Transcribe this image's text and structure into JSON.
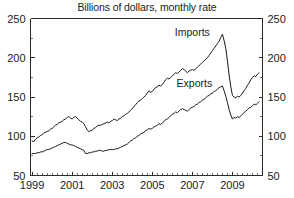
{
  "figure": {
    "subtitle": "Billions of dollars, monthly rate",
    "cut_off_title_fragment": "U.S. International Trade"
  },
  "chart_data": {
    "type": "line",
    "title": "",
    "subtitle": "Billions of dollars, monthly rate",
    "xlabel": "",
    "ylabel": "Billions of dollars, monthly rate",
    "xlim": [
      1998.92,
      2010.5
    ],
    "ylim": [
      50,
      250
    ],
    "ytick_labels": [
      "50",
      "100",
      "150",
      "200",
      "250"
    ],
    "ytick_values": [
      50,
      100,
      150,
      200,
      250
    ],
    "yminor_step": 25,
    "xtick_labels": [
      "1999",
      "2001",
      "2003",
      "2005",
      "2007",
      "2009"
    ],
    "xtick_values": [
      1999,
      2001,
      2003,
      2005,
      2007,
      2009
    ],
    "xminor_step": 0.25,
    "grid": false,
    "legend_position": "inline-annotation",
    "dual_y_axis": true,
    "right_axis_tick_labels": [
      "50",
      "100",
      "150",
      "200",
      "250"
    ],
    "annotations": [
      {
        "text": "Imports",
        "x": 2007.0,
        "y": 228
      },
      {
        "text": "Exports",
        "x": 2007.1,
        "y": 163
      }
    ],
    "series": [
      {
        "name": "Imports",
        "x": [
          1999.0,
          1999.083,
          1999.167,
          1999.25,
          1999.333,
          1999.417,
          1999.5,
          1999.583,
          1999.667,
          1999.75,
          1999.833,
          1999.917,
          2000.0,
          2000.083,
          2000.167,
          2000.25,
          2000.333,
          2000.417,
          2000.5,
          2000.583,
          2000.667,
          2000.75,
          2000.833,
          2000.917,
          2001.0,
          2001.083,
          2001.167,
          2001.25,
          2001.333,
          2001.417,
          2001.5,
          2001.583,
          2001.667,
          2001.75,
          2001.833,
          2001.917,
          2002.0,
          2002.083,
          2002.167,
          2002.25,
          2002.333,
          2002.417,
          2002.5,
          2002.583,
          2002.667,
          2002.75,
          2002.833,
          2002.917,
          2003.0,
          2003.083,
          2003.167,
          2003.25,
          2003.333,
          2003.417,
          2003.5,
          2003.583,
          2003.667,
          2003.75,
          2003.833,
          2003.917,
          2004.0,
          2004.083,
          2004.167,
          2004.25,
          2004.333,
          2004.417,
          2004.5,
          2004.583,
          2004.667,
          2004.75,
          2004.833,
          2004.917,
          2005.0,
          2005.083,
          2005.167,
          2005.25,
          2005.333,
          2005.417,
          2005.5,
          2005.583,
          2005.667,
          2005.75,
          2005.833,
          2005.917,
          2006.0,
          2006.083,
          2006.167,
          2006.25,
          2006.333,
          2006.417,
          2006.5,
          2006.583,
          2006.667,
          2006.75,
          2006.833,
          2006.917,
          2007.0,
          2007.083,
          2007.167,
          2007.25,
          2007.333,
          2007.417,
          2007.5,
          2007.583,
          2007.667,
          2007.75,
          2007.833,
          2007.917,
          2008.0,
          2008.083,
          2008.167,
          2008.25,
          2008.333,
          2008.417,
          2008.5,
          2008.583,
          2008.667,
          2008.75,
          2008.833,
          2008.917,
          2009.0,
          2009.083,
          2009.167,
          2009.25,
          2009.333,
          2009.417,
          2009.5,
          2009.583,
          2009.667,
          2009.75,
          2009.833,
          2009.917,
          2010.0,
          2010.083,
          2010.167,
          2010.25,
          2010.333
        ],
        "values": [
          94,
          93,
          96,
          98,
          99,
          101,
          102,
          104,
          105,
          106,
          107,
          109,
          110,
          112,
          114,
          115,
          117,
          118,
          119,
          121,
          122,
          124,
          125,
          123,
          122,
          124,
          125,
          123,
          121,
          119,
          118,
          116,
          112,
          108,
          106,
          107,
          108,
          110,
          111,
          113,
          114,
          114,
          115,
          116,
          117,
          118,
          117,
          119,
          120,
          122,
          121,
          120,
          122,
          123,
          125,
          126,
          128,
          129,
          131,
          133,
          135,
          138,
          140,
          143,
          145,
          146,
          148,
          150,
          152,
          155,
          158,
          156,
          157,
          160,
          162,
          163,
          165,
          164,
          166,
          169,
          172,
          174,
          173,
          175,
          177,
          179,
          181,
          180,
          182,
          184,
          186,
          185,
          183,
          181,
          183,
          184,
          185,
          184,
          186,
          188,
          190,
          192,
          194,
          196,
          198,
          200,
          203,
          206,
          209,
          212,
          215,
          218,
          221,
          226,
          230,
          222,
          212,
          196,
          178,
          163,
          152,
          150,
          149,
          151,
          150,
          152,
          155,
          158,
          161,
          165,
          168,
          172,
          175,
          177,
          176,
          179,
          181
        ]
      },
      {
        "name": "Exports",
        "x": [
          1999.0,
          1999.083,
          1999.167,
          1999.25,
          1999.333,
          1999.417,
          1999.5,
          1999.583,
          1999.667,
          1999.75,
          1999.833,
          1999.917,
          2000.0,
          2000.083,
          2000.167,
          2000.25,
          2000.333,
          2000.417,
          2000.5,
          2000.583,
          2000.667,
          2000.75,
          2000.833,
          2000.917,
          2001.0,
          2001.083,
          2001.167,
          2001.25,
          2001.333,
          2001.417,
          2001.5,
          2001.583,
          2001.667,
          2001.75,
          2001.833,
          2001.917,
          2002.0,
          2002.083,
          2002.167,
          2002.25,
          2002.333,
          2002.417,
          2002.5,
          2002.583,
          2002.667,
          2002.75,
          2002.833,
          2002.917,
          2003.0,
          2003.083,
          2003.167,
          2003.25,
          2003.333,
          2003.417,
          2003.5,
          2003.583,
          2003.667,
          2003.75,
          2003.833,
          2003.917,
          2004.0,
          2004.083,
          2004.167,
          2004.25,
          2004.333,
          2004.417,
          2004.5,
          2004.583,
          2004.667,
          2004.75,
          2004.833,
          2004.917,
          2005.0,
          2005.083,
          2005.167,
          2005.25,
          2005.333,
          2005.417,
          2005.5,
          2005.583,
          2005.667,
          2005.75,
          2005.833,
          2005.917,
          2006.0,
          2006.083,
          2006.167,
          2006.25,
          2006.333,
          2006.417,
          2006.5,
          2006.583,
          2006.667,
          2006.75,
          2006.833,
          2006.917,
          2007.0,
          2007.083,
          2007.167,
          2007.25,
          2007.333,
          2007.417,
          2007.5,
          2007.583,
          2007.667,
          2007.75,
          2007.833,
          2007.917,
          2008.0,
          2008.083,
          2008.167,
          2008.25,
          2008.333,
          2008.417,
          2008.5,
          2008.583,
          2008.667,
          2008.75,
          2008.833,
          2008.917,
          2009.0,
          2009.083,
          2009.167,
          2009.25,
          2009.333,
          2009.417,
          2009.5,
          2009.583,
          2009.667,
          2009.75,
          2009.833,
          2009.917,
          2010.0,
          2010.083,
          2010.167,
          2010.25,
          2010.333
        ],
        "values": [
          78,
          78,
          78,
          79,
          79,
          80,
          80,
          81,
          82,
          83,
          83,
          84,
          85,
          86,
          87,
          88,
          89,
          90,
          91,
          92,
          92,
          91,
          90,
          89,
          89,
          88,
          87,
          86,
          85,
          84,
          83,
          82,
          78,
          78,
          79,
          79,
          80,
          80,
          81,
          81,
          82,
          82,
          81,
          81,
          82,
          82,
          83,
          83,
          83,
          83,
          84,
          84,
          85,
          86,
          87,
          88,
          89,
          90,
          92,
          94,
          95,
          97,
          98,
          100,
          101,
          103,
          104,
          105,
          107,
          108,
          110,
          109,
          110,
          112,
          113,
          114,
          116,
          115,
          117,
          119,
          121,
          122,
          124,
          126,
          128,
          129,
          131,
          130,
          132,
          134,
          135,
          134,
          133,
          132,
          134,
          136,
          137,
          138,
          140,
          141,
          143,
          144,
          146,
          147,
          149,
          151,
          152,
          154,
          155,
          157,
          158,
          160,
          162,
          163,
          164,
          158,
          151,
          143,
          134,
          127,
          122,
          124,
          123,
          125,
          124,
          126,
          128,
          130,
          132,
          134,
          136,
          137,
          139,
          141,
          140,
          142,
          144
        ]
      }
    ]
  }
}
